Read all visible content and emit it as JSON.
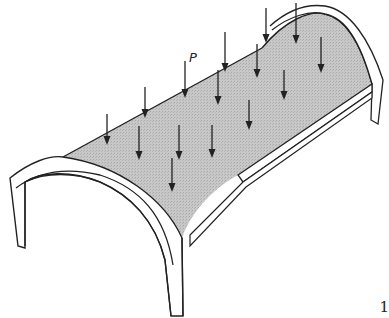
{
  "figure": {
    "load_label": "P",
    "page_number_fragment": "1",
    "colors": {
      "shell_fill": "#c4c4c4",
      "stroke": "#222222",
      "background": "#ffffff"
    },
    "load_arrows": [
      {
        "x": 107,
        "y1": 114,
        "y2": 145
      },
      {
        "x": 139,
        "y1": 126,
        "y2": 160
      },
      {
        "x": 145,
        "y1": 87,
        "y2": 118
      },
      {
        "x": 179,
        "y1": 125,
        "y2": 160
      },
      {
        "x": 172,
        "y1": 158,
        "y2": 192
      },
      {
        "x": 185,
        "y1": 61,
        "y2": 98
      },
      {
        "x": 218,
        "y1": 70,
        "y2": 105
      },
      {
        "x": 212,
        "y1": 125,
        "y2": 158
      },
      {
        "x": 225,
        "y1": 32,
        "y2": 72
      },
      {
        "x": 249,
        "y1": 100,
        "y2": 130
      },
      {
        "x": 257,
        "y1": 44,
        "y2": 78
      },
      {
        "x": 266,
        "y1": 8,
        "y2": 43
      },
      {
        "x": 284,
        "y1": 70,
        "y2": 100
      },
      {
        "x": 296,
        "y1": 3,
        "y2": 44
      },
      {
        "x": 321,
        "y1": 37,
        "y2": 73
      }
    ]
  }
}
